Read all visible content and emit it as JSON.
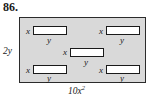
{
  "figure": {
    "problem_number": "86.",
    "outer_region": {
      "fill_color": "#d9d9d9",
      "border_color": "#2b2b2b",
      "height_label": "2y",
      "width_label": "10x",
      "width_label_exponent": "2"
    },
    "tiles": [
      {
        "id": "top-left",
        "left_label": "x",
        "bottom_label": "y"
      },
      {
        "id": "top-right",
        "left_label": "x",
        "bottom_label": "y"
      },
      {
        "id": "center",
        "left_label": "x",
        "bottom_label": "y"
      },
      {
        "id": "bottom-left",
        "left_label": "x",
        "bottom_label": "y"
      },
      {
        "id": "bottom-right",
        "left_label": "x",
        "bottom_label": "y"
      }
    ]
  }
}
